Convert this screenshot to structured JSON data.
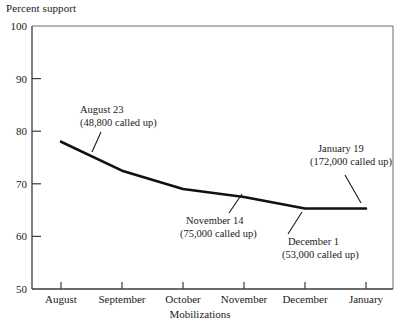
{
  "chart_data": {
    "type": "line",
    "title": "",
    "ylabel": "Percent support",
    "xlabel": "Mobilizations",
    "categories": [
      "August",
      "September",
      "October",
      "November",
      "December",
      "January"
    ],
    "values": [
      78,
      72.5,
      69,
      67.5,
      65.3,
      65.3
    ],
    "ylim": [
      50,
      100
    ],
    "yticks": [
      50,
      60,
      70,
      80,
      90,
      100
    ],
    "ytick_labels": [
      "50",
      "60",
      "70",
      "80",
      "90",
      "100"
    ],
    "grid": false,
    "legend": "none",
    "series": [
      {
        "name": "Percent support",
        "values": [
          78,
          72.5,
          69,
          67.5,
          65.3,
          65.3
        ]
      }
    ],
    "annotations": [
      {
        "line1": "August 23",
        "line2": "(48,800 called up)",
        "target_category": "August",
        "target_value": 78,
        "placement": "above-right"
      },
      {
        "line1": "November 14",
        "line2": "(75,000 called up)",
        "target_category": "November",
        "target_value": 67.5,
        "placement": "below-left"
      },
      {
        "line1": "December 1",
        "line2": "(53,000 called up)",
        "target_category": "December",
        "target_value": 65.3,
        "placement": "below-right"
      },
      {
        "line1": "January 19",
        "line2": "(172,000 called up)",
        "target_category": "January",
        "target_value": 65.3,
        "placement": "above-left"
      }
    ]
  },
  "axes": {
    "y_axis_caption": "Percent support",
    "x_axis_caption": "Mobilizations",
    "y_tick_100": "100",
    "y_tick_90": "90",
    "y_tick_80": "80",
    "y_tick_70": "70",
    "y_tick_60": "60",
    "y_tick_50": "50",
    "x_tick_1": "August",
    "x_tick_2": "September",
    "x_tick_3": "October",
    "x_tick_4": "November",
    "x_tick_5": "December",
    "x_tick_6": "January"
  },
  "annotations": {
    "a1_l1": "August 23",
    "a1_l2": "(48,800 called up)",
    "a2_l1": "November 14",
    "a2_l2": "(75,000 called up)",
    "a3_l1": "December 1",
    "a3_l2": "(53,000 called up)",
    "a4_l1": "January 19",
    "a4_l2": "(172,000 called up)"
  },
  "colors": {
    "line": "#111111",
    "axis": "#3a3a3a",
    "background": "#ffffff",
    "text": "#1a1a1a"
  }
}
